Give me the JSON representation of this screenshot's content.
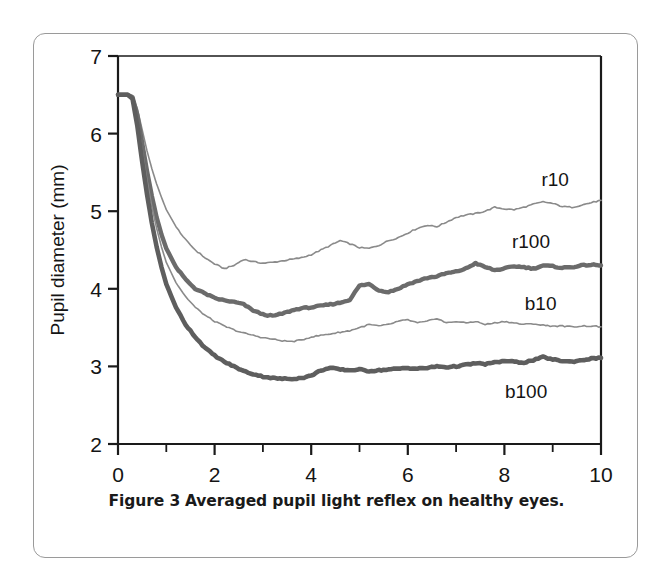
{
  "figure": {
    "caption_label": "Figure 3",
    "caption_text": "Averaged pupil light reflex on healthy eyes."
  },
  "chart_data": {
    "type": "line",
    "title": "",
    "xlabel": "Duration (sec.)",
    "ylabel": "Pupil diameter (mm)",
    "xlim": [
      0,
      10
    ],
    "ylim": [
      2,
      7
    ],
    "xticks": [
      0,
      2,
      4,
      6,
      8,
      10
    ],
    "xtick_labels": [
      "0",
      "2",
      "4",
      "6",
      "8",
      "10"
    ],
    "xminor_ticks": [
      1,
      3,
      5,
      7,
      9
    ],
    "yticks": [
      2,
      3,
      4,
      5,
      6,
      7
    ],
    "ytick_labels": [
      "2",
      "3",
      "4",
      "5",
      "6",
      "7"
    ],
    "grid": false,
    "legend_position": "inline-right",
    "x": [
      0,
      0.1,
      0.2,
      0.3,
      0.4,
      0.5,
      0.6,
      0.7,
      0.8,
      0.9,
      1.0,
      1.2,
      1.4,
      1.6,
      1.8,
      2.0,
      2.2,
      2.4,
      2.6,
      2.8,
      3.0,
      3.2,
      3.4,
      3.6,
      3.8,
      4.0,
      4.2,
      4.4,
      4.6,
      4.8,
      5.0,
      5.2,
      5.4,
      5.6,
      5.8,
      6.0,
      6.2,
      6.4,
      6.6,
      6.8,
      7.0,
      7.2,
      7.4,
      7.6,
      7.8,
      8.0,
      8.2,
      8.4,
      8.6,
      8.8,
      9.0,
      9.2,
      9.4,
      9.6,
      9.8,
      10.0
    ],
    "series": [
      {
        "name": "r10",
        "label": "r10",
        "color": "#8a8a8a",
        "width": 1.6,
        "label_x": 9.05,
        "label_y": 5.42,
        "values": [
          6.5,
          6.5,
          6.5,
          6.48,
          6.32,
          6.05,
          5.78,
          5.55,
          5.35,
          5.18,
          5.02,
          4.8,
          4.63,
          4.5,
          4.4,
          4.32,
          4.26,
          4.3,
          4.38,
          4.35,
          4.33,
          4.34,
          4.36,
          4.38,
          4.4,
          4.44,
          4.5,
          4.56,
          4.62,
          4.58,
          4.53,
          4.52,
          4.56,
          4.62,
          4.66,
          4.72,
          4.78,
          4.82,
          4.8,
          4.86,
          4.92,
          4.95,
          4.97,
          5.0,
          5.05,
          5.03,
          5.02,
          5.05,
          5.09,
          5.12,
          5.1,
          5.06,
          5.05,
          5.08,
          5.11,
          5.14
        ]
      },
      {
        "name": "r100",
        "label": "r100",
        "color": "#6b6b6b",
        "width": 4.4,
        "label_x": 8.55,
        "label_y": 4.62,
        "values": [
          6.5,
          6.5,
          6.5,
          6.47,
          6.24,
          5.88,
          5.52,
          5.2,
          4.92,
          4.7,
          4.52,
          4.28,
          4.12,
          4.0,
          3.94,
          3.88,
          3.85,
          3.83,
          3.8,
          3.72,
          3.67,
          3.65,
          3.68,
          3.72,
          3.75,
          3.76,
          3.78,
          3.8,
          3.82,
          3.86,
          4.04,
          4.06,
          3.98,
          3.96,
          4.0,
          4.06,
          4.1,
          4.14,
          4.16,
          4.2,
          4.22,
          4.26,
          4.33,
          4.28,
          4.24,
          4.26,
          4.29,
          4.28,
          4.26,
          4.3,
          4.29,
          4.27,
          4.28,
          4.3,
          4.31,
          4.3
        ]
      },
      {
        "name": "b10",
        "label": "b10",
        "color": "#8a8a8a",
        "width": 1.6,
        "label_x": 8.75,
        "label_y": 3.82,
        "values": [
          6.5,
          6.5,
          6.5,
          6.46,
          6.18,
          5.78,
          5.4,
          5.06,
          4.78,
          4.54,
          4.34,
          4.08,
          3.9,
          3.76,
          3.66,
          3.58,
          3.52,
          3.47,
          3.43,
          3.4,
          3.37,
          3.35,
          3.33,
          3.32,
          3.34,
          3.38,
          3.4,
          3.42,
          3.44,
          3.46,
          3.5,
          3.54,
          3.52,
          3.54,
          3.58,
          3.6,
          3.56,
          3.58,
          3.62,
          3.56,
          3.58,
          3.56,
          3.58,
          3.54,
          3.56,
          3.58,
          3.56,
          3.54,
          3.55,
          3.53,
          3.52,
          3.52,
          3.51,
          3.52,
          3.52,
          3.51
        ]
      },
      {
        "name": "b100",
        "label": "b100",
        "color": "#5e5e5e",
        "width": 4.6,
        "label_x": 8.45,
        "label_y": 2.68,
        "values": [
          6.5,
          6.5,
          6.5,
          6.45,
          6.1,
          5.64,
          5.22,
          4.85,
          4.54,
          4.28,
          4.06,
          3.76,
          3.54,
          3.38,
          3.24,
          3.14,
          3.06,
          3.0,
          2.94,
          2.9,
          2.87,
          2.85,
          2.84,
          2.84,
          2.85,
          2.88,
          2.95,
          2.98,
          2.96,
          2.95,
          2.96,
          2.94,
          2.95,
          2.96,
          2.97,
          2.98,
          2.97,
          2.98,
          3.0,
          2.99,
          3.0,
          3.02,
          3.04,
          3.03,
          3.05,
          3.07,
          3.06,
          3.05,
          3.08,
          3.12,
          3.09,
          3.07,
          3.06,
          3.08,
          3.1,
          3.11
        ]
      }
    ]
  }
}
